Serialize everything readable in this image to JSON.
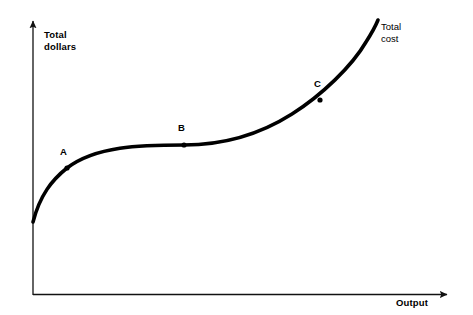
{
  "figure": {
    "width": 473,
    "height": 315,
    "background_color": "#ffffff",
    "ink_color": "#000000"
  },
  "axes": {
    "y_label": "Total\ndollars",
    "x_label": "Output",
    "y_label_bold": true,
    "x_label_bold": true,
    "origin": {
      "x": 33,
      "y": 295
    },
    "y_arrow_tip": {
      "x": 33,
      "y": 17
    },
    "x_arrow_tip": {
      "x": 452,
      "y": 295
    },
    "ticks": [],
    "gridlines": false
  },
  "curve": {
    "label": "Total\ncost",
    "label_bold": false,
    "color": "#000000",
    "stroke_width": 3.6,
    "path": "M 33,222 C 40,195 52,180 67,168 C 96,146 140,145 184,145 C 228,145 262,133 292,114 C 322,95 352,66 366,42 C 373,31 376,25 378,20"
  },
  "points": [
    {
      "id": "A",
      "label": "A",
      "x": 67,
      "y": 168,
      "label_x": 60,
      "label_y": 147
    },
    {
      "id": "B",
      "label": "B",
      "x": 184,
      "y": 145,
      "label_x": 178,
      "label_y": 123
    },
    {
      "id": "C",
      "label": "C",
      "x": 320,
      "y": 100,
      "label_x": 314,
      "label_y": 79
    }
  ],
  "chart_data": {
    "type": "line",
    "title": "",
    "subtitle": "",
    "xlabel": "Output",
    "ylabel": "Total dollars",
    "xlim": [
      0,
      1
    ],
    "ylim": [
      0,
      1
    ],
    "grid": false,
    "legend": "none",
    "axis_ticks": {
      "x": [],
      "y": []
    },
    "series": [
      {
        "name": "Total cost",
        "description": "S-shaped (cubic) total cost curve: rises steeply from a positive intercept (fixed cost), flattens through the region of increasing returns, then rises sharply with diminishing returns.",
        "x": [
          0.0,
          0.05,
          0.09,
          0.16,
          0.26,
          0.36,
          0.43,
          0.52,
          0.62,
          0.68,
          0.76,
          0.82,
          0.86,
          0.9,
          0.92
        ],
        "y": [
          0.26,
          0.38,
          0.46,
          0.5,
          0.53,
          0.54,
          0.54,
          0.57,
          0.62,
          0.7,
          0.78,
          0.86,
          0.91,
          0.96,
          1.0
        ]
      }
    ],
    "annotations": [
      {
        "text": "A",
        "x": 0.09,
        "y": 0.46,
        "note": "point of diminishing marginal returns begins to show"
      },
      {
        "text": "B",
        "x": 0.36,
        "y": 0.54,
        "note": "inflection point of the total cost curve"
      },
      {
        "text": "C",
        "x": 0.68,
        "y": 0.7,
        "note": "point on the steeply rising portion"
      },
      {
        "text": "Total cost",
        "x": 0.92,
        "y": 1.0,
        "note": "curve end label"
      }
    ]
  }
}
